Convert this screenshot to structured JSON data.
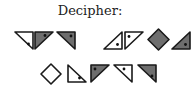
{
  "title": "Decipher:",
  "colors": {
    "stroke": "#1a1a1a",
    "gray": "#6e6e6e",
    "white": "#ffffff",
    "dot": "#111111"
  },
  "rows": [
    {
      "groups": [
        [
          {
            "shape": "triangle",
            "corners": "tl-tr-br",
            "fill": "white",
            "dot": "bottom-right"
          },
          {
            "shape": "triangle",
            "corners": "tl-tr-bl",
            "fill": "gray",
            "dot": "top-right"
          },
          {
            "shape": "triangle",
            "corners": "tl-tr-br",
            "fill": "gray",
            "dot": "top-right"
          }
        ],
        [
          {
            "shape": "triangle",
            "corners": "tr-bl-br",
            "fill": "white",
            "dot": "bottom-right"
          },
          {
            "shape": "triangle",
            "corners": "tl-tr-bl",
            "fill": "white",
            "dot": "top-left"
          },
          {
            "shape": "diamond",
            "fill": "gray",
            "dot": "none"
          },
          {
            "shape": "triangle",
            "corners": "tr-bl-br",
            "fill": "gray",
            "dot": "bottom-right"
          }
        ]
      ]
    },
    {
      "groups": [
        [
          {
            "shape": "diamond",
            "fill": "white",
            "dot": "none"
          },
          {
            "shape": "triangle",
            "corners": "tl-bl-br",
            "fill": "white",
            "dot": "bottom-right"
          },
          {
            "shape": "triangle",
            "corners": "tl-tr-bl",
            "fill": "gray",
            "dot": "top-left"
          },
          {
            "shape": "triangle",
            "corners": "tl-tr-br",
            "fill": "white",
            "dot": "top-right"
          },
          {
            "shape": "triangle",
            "corners": "tl-tr-br",
            "fill": "gray",
            "dot": "bottom-right"
          }
        ]
      ]
    }
  ]
}
